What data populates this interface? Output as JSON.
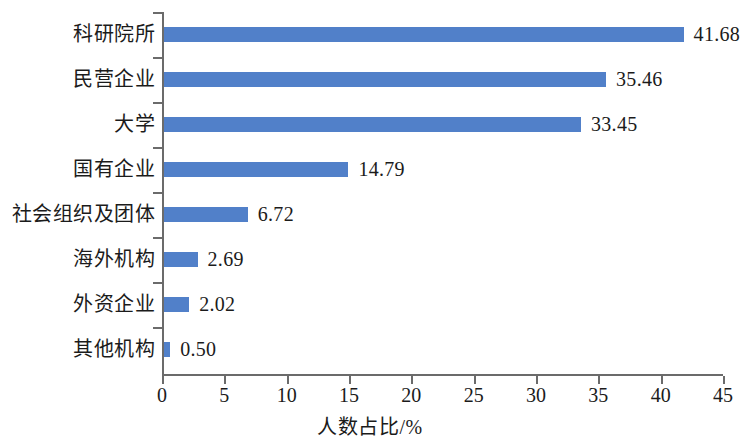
{
  "chart_data": {
    "type": "bar",
    "orientation": "horizontal",
    "title": "",
    "subtitle": "",
    "xlabel": "人数占比/%",
    "ylabel": "",
    "xlim": [
      0,
      45
    ],
    "xticks": [
      "0",
      "5",
      "10",
      "15",
      "20",
      "25",
      "30",
      "35",
      "40",
      "45"
    ],
    "xtick_step": 5,
    "grid": false,
    "legend": null,
    "bar_color": "#5180c9",
    "axis_color": "#6b6b6b",
    "text_color": "#1b1b1b",
    "background": "#ffffff",
    "categories": [
      "科研院所",
      "民营企业",
      "大学",
      "国有企业",
      "社会组织及团体",
      "海外机构",
      "外资企业",
      "其他机构"
    ],
    "values": [
      41.68,
      35.46,
      33.45,
      14.79,
      6.72,
      2.69,
      2.02,
      0.5
    ],
    "value_labels": [
      "41.68",
      "35.46",
      "33.45",
      "14.79",
      "6.72",
      "2.69",
      "2.02",
      "0.50"
    ]
  }
}
